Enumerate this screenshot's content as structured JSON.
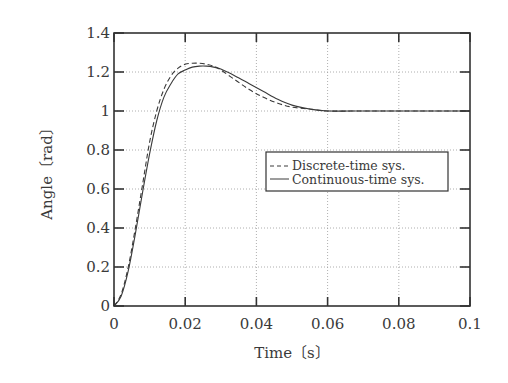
{
  "chart_data": {
    "type": "line",
    "title": "",
    "xlabel": "Time〔s〕",
    "ylabel": "Angle〔rad〕",
    "xlim": [
      0,
      0.1
    ],
    "ylim": [
      0,
      1.4
    ],
    "xticks": [
      0,
      0.02,
      0.04,
      0.06,
      0.08,
      0.1
    ],
    "xtick_labels": [
      "0",
      "0.02",
      "0.04",
      "0.06",
      "0.08",
      "0.1"
    ],
    "yticks": [
      0,
      0.2,
      0.4,
      0.6,
      0.8,
      1,
      1.2,
      1.4
    ],
    "ytick_labels": [
      "0",
      "0.2",
      "0.4",
      "0.6",
      "0.8",
      "1",
      "1.2",
      "1.4"
    ],
    "grid": true,
    "legend_position": "center-right",
    "series": [
      {
        "name": "Discrete-time sys.",
        "style": "dashed",
        "x": [
          0,
          0.002,
          0.004,
          0.006,
          0.008,
          0.01,
          0.012,
          0.014,
          0.016,
          0.018,
          0.02,
          0.022,
          0.024,
          0.026,
          0.028,
          0.03,
          0.034,
          0.038,
          0.042,
          0.046,
          0.05,
          0.055,
          0.06,
          0.07,
          0.08,
          0.09,
          0.1
        ],
        "y": [
          0,
          0.06,
          0.2,
          0.4,
          0.62,
          0.84,
          1.0,
          1.11,
          1.18,
          1.22,
          1.24,
          1.245,
          1.245,
          1.24,
          1.23,
          1.21,
          1.16,
          1.11,
          1.07,
          1.04,
          1.02,
          1.01,
          1.0,
          1.0,
          1.0,
          1.0,
          1.0
        ]
      },
      {
        "name": "Continuous-time sys.",
        "style": "solid",
        "x": [
          0,
          0.002,
          0.004,
          0.006,
          0.008,
          0.01,
          0.012,
          0.014,
          0.016,
          0.018,
          0.02,
          0.022,
          0.024,
          0.026,
          0.028,
          0.03,
          0.034,
          0.038,
          0.042,
          0.046,
          0.05,
          0.055,
          0.06,
          0.07,
          0.08,
          0.09,
          0.1
        ],
        "y": [
          0,
          0.05,
          0.18,
          0.37,
          0.58,
          0.78,
          0.95,
          1.07,
          1.14,
          1.19,
          1.21,
          1.225,
          1.23,
          1.23,
          1.225,
          1.215,
          1.18,
          1.14,
          1.1,
          1.06,
          1.03,
          1.01,
          1.0,
          1.0,
          1.0,
          1.0,
          1.0
        ]
      }
    ]
  },
  "colors": {
    "axis": "#333333",
    "grid": "#9a9a9a",
    "line": "#3a3a3a"
  }
}
